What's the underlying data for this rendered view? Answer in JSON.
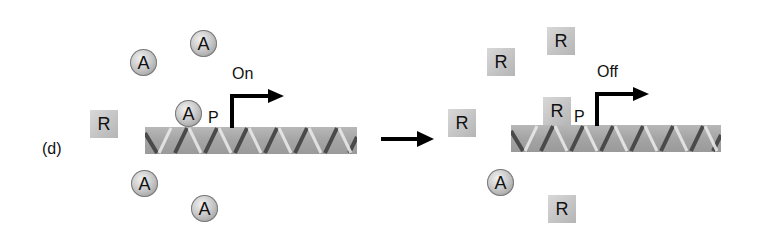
{
  "panel_label": "(d)",
  "symbols": {
    "activator": "A",
    "repressor": "R",
    "promoter": "P"
  },
  "left_panel": {
    "state_label": "On",
    "free_activators": [
      "A",
      "A",
      "A",
      "A"
    ],
    "bound_activator": "A",
    "free_repressors": [
      "R"
    ],
    "promoter_label": "P"
  },
  "transition_arrow": "right-arrow",
  "right_panel": {
    "state_label": "Off",
    "free_repressors": [
      "R",
      "R",
      "R",
      "R"
    ],
    "bound_repressor": "R",
    "free_activators": [
      "A"
    ],
    "promoter_label": "P"
  },
  "colors": {
    "dna_base": "#a9a9a9",
    "dna_strand_dark": "#4a4a4a",
    "dna_strand_light": "#e6e6e6",
    "activator_fill": "#c9c9c9",
    "repressor_fill": "#c6c6c6",
    "arrow": "#000000"
  }
}
